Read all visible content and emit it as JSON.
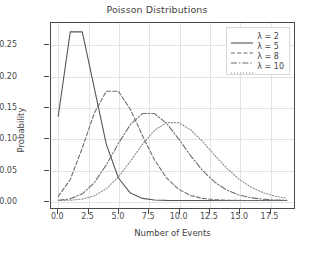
{
  "chart_data": {
    "type": "line",
    "title": "Poisson Distributions",
    "xlabel": "Number of Events",
    "ylabel": "Probability",
    "xlim": [
      -0.6,
      19.6
    ],
    "ylim": [
      -0.012,
      0.285
    ],
    "grid": true,
    "legend_position": "upper right",
    "xticks": [
      "0.0",
      "2.5",
      "5.0",
      "7.5",
      "10.0",
      "12.5",
      "15.0",
      "17.5"
    ],
    "xtick_values": [
      0.0,
      2.5,
      5.0,
      7.5,
      10.0,
      12.5,
      15.0,
      17.5
    ],
    "yticks": [
      "0.00",
      "0.05",
      "0.10",
      "0.15",
      "0.20",
      "0.25"
    ],
    "ytick_values": [
      0.0,
      0.05,
      0.1,
      0.15,
      0.2,
      0.25
    ],
    "x": [
      0,
      1,
      2,
      3,
      4,
      5,
      6,
      7,
      8,
      9,
      10,
      11,
      12,
      13,
      14,
      15,
      16,
      17,
      18,
      19
    ],
    "series": [
      {
        "name": "λ = 2",
        "lambda": 2,
        "linestyle": "solid",
        "color": "#555555",
        "values": [
          0.1353,
          0.2707,
          0.2707,
          0.1804,
          0.0902,
          0.0361,
          0.012,
          0.0034,
          0.0009,
          0.0002,
          0.0,
          0.0,
          0.0,
          0.0,
          0.0,
          0.0,
          0.0,
          0.0,
          0.0,
          0.0
        ]
      },
      {
        "name": "λ = 5",
        "lambda": 5,
        "linestyle": "dashed",
        "color": "#6e6e6e",
        "values": [
          0.0067,
          0.0337,
          0.0842,
          0.1404,
          0.1755,
          0.1755,
          0.1462,
          0.1044,
          0.0653,
          0.0363,
          0.0181,
          0.0082,
          0.0034,
          0.0013,
          0.0005,
          0.0002,
          0.0,
          0.0,
          0.0,
          0.0
        ]
      },
      {
        "name": "λ = 8",
        "lambda": 8,
        "linestyle": "dashdot",
        "color": "#6e6e6e",
        "values": [
          0.0003,
          0.0027,
          0.0107,
          0.0286,
          0.0573,
          0.0916,
          0.1221,
          0.1396,
          0.1396,
          0.1241,
          0.0993,
          0.0722,
          0.0481,
          0.0296,
          0.0169,
          0.009,
          0.0045,
          0.0021,
          0.0009,
          0.0004
        ]
      },
      {
        "name": "λ = 10",
        "lambda": 10,
        "linestyle": "dotted",
        "color": "#8a8a8a",
        "values": [
          0.0,
          0.0005,
          0.0023,
          0.0076,
          0.0189,
          0.0378,
          0.0631,
          0.0901,
          0.1126,
          0.1251,
          0.1251,
          0.1137,
          0.0948,
          0.0729,
          0.0521,
          0.0347,
          0.0217,
          0.0128,
          0.0071,
          0.0037
        ]
      }
    ]
  },
  "legend": {
    "entries": [
      "λ = 2",
      "λ = 5",
      "λ = 8",
      "λ = 10"
    ]
  }
}
